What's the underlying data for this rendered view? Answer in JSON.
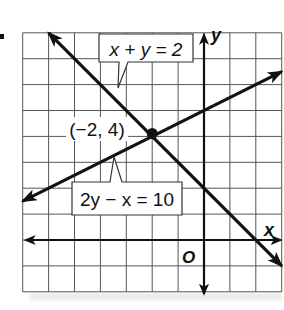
{
  "chart_data": {
    "type": "line",
    "title": "",
    "xlabel": "x",
    "ylabel": "y",
    "origin_label": "O",
    "xlim": [
      -7,
      3
    ],
    "ylim": [
      -2,
      8
    ],
    "grid": true,
    "grid_step": 1,
    "tick_labels_shown": false,
    "series": [
      {
        "name": "x + y = 2",
        "equation": "x + y = 2",
        "slope": -1,
        "intercept": 2,
        "x": [
          -6,
          3
        ],
        "y": [
          8,
          -1
        ],
        "arrows": "both"
      },
      {
        "name": "2y − x = 10",
        "equation": "2y - x = 10",
        "slope": 0.5,
        "intercept": 5,
        "x": [
          -7,
          3
        ],
        "y": [
          1.5,
          6.5
        ],
        "arrows": "both"
      }
    ],
    "points": [
      {
        "label": "(−2, 4)",
        "x": -2,
        "y": 4
      }
    ],
    "annotations": [
      {
        "text": "x + y = 2",
        "type": "callout",
        "points_to_series": 0
      },
      {
        "text": "2y − x = 10",
        "type": "callout",
        "points_to_series": 1
      },
      {
        "text": "(−2, 4)",
        "type": "point-label"
      }
    ]
  },
  "labels": {
    "eq1": "x + y = 2",
    "eq2": "2y − x = 10",
    "point": "(−2, 4)",
    "x_axis": "x",
    "y_axis": "y",
    "origin": "O"
  },
  "colors": {
    "line": "#111111",
    "grid": "#555555",
    "background": "#ffffff"
  }
}
